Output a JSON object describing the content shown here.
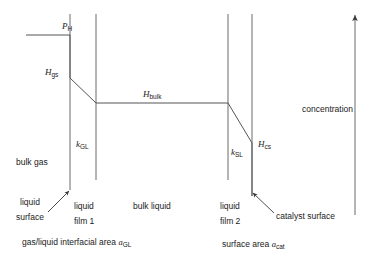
{
  "diagram": {
    "axis": {
      "name": "concentration-axis",
      "label": "concentration",
      "direction": "up",
      "x": 355,
      "y_top": 14,
      "y_bottom": 215
    },
    "profile_labels": [
      {
        "name": "p-h",
        "symbol": "P",
        "sub": "H",
        "x": 62,
        "y": 22
      },
      {
        "name": "h-gs",
        "symbol": "H",
        "sub": "gs",
        "x": 45,
        "y": 68
      },
      {
        "name": "h-bulk",
        "symbol": "H",
        "sub": "bulk",
        "x": 143,
        "y": 90
      },
      {
        "name": "h-cs",
        "symbol": "H",
        "sub": "cs",
        "x": 258,
        "y": 140
      }
    ],
    "coefficient_labels": [
      {
        "name": "k-gl",
        "symbol": "k",
        "sub": "GL",
        "x": 76,
        "y": 140
      },
      {
        "name": "k-sl",
        "symbol": "k",
        "sub": "SL",
        "x": 231,
        "y": 148
      }
    ],
    "zone_labels": [
      {
        "name": "bulk-gas",
        "text": "bulk gas",
        "x": 16,
        "y": 158
      },
      {
        "name": "bulk-liquid",
        "text": "bulk liquid",
        "x": 133,
        "y": 202
      }
    ],
    "callout_labels": [
      {
        "name": "liquid-surface",
        "line1": "liquid",
        "line2": "surface",
        "x": 10,
        "y": 198
      },
      {
        "name": "liquid-film-1",
        "line1": "liquid",
        "line2": "film 1",
        "x": 74,
        "y": 202
      },
      {
        "name": "liquid-film-2",
        "line1": "liquid",
        "line2": "film 2",
        "x": 220,
        "y": 202
      },
      {
        "name": "catalyst-surface",
        "line1": "catalyst surface",
        "line2": "",
        "x": 268,
        "y": 212
      }
    ],
    "area_labels": [
      {
        "name": "gas-liquid-interfacial-area",
        "text": "gas/liquid interfacial area ",
        "symbol": "a",
        "sub": "GL",
        "x": 22,
        "y": 238
      },
      {
        "name": "catalyst-surface-area",
        "text": "surface area ",
        "symbol": "a",
        "sub": "cat",
        "x": 222,
        "y": 240
      }
    ],
    "geometry": {
      "boundaries": [
        {
          "name": "gas-film-boundary-left",
          "x": 70,
          "y1": 14,
          "y2": 190
        },
        {
          "name": "liquid-film-1-boundary",
          "x": 96,
          "y1": 14,
          "y2": 180
        },
        {
          "name": "liquid-film-2-boundary",
          "x": 228,
          "y1": 14,
          "y2": 180
        },
        {
          "name": "catalyst-boundary-right",
          "x": 252,
          "y1": 14,
          "y2": 196
        }
      ],
      "profile_path": [
        {
          "name": "ph-plateau",
          "x1": 26,
          "y1": 35,
          "x2": 70,
          "y2": 35
        },
        {
          "name": "gas-jump",
          "x1": 70,
          "y1": 35,
          "x2": 70,
          "y2": 78
        },
        {
          "name": "liquid-film-1-drop",
          "x1": 70,
          "y1": 78,
          "x2": 96,
          "y2": 103
        },
        {
          "name": "bulk-liquid-flat",
          "x1": 96,
          "y1": 103,
          "x2": 228,
          "y2": 103
        },
        {
          "name": "liquid-film-2-drop",
          "x1": 228,
          "y1": 103,
          "x2": 252,
          "y2": 143
        },
        {
          "name": "catalyst-tail",
          "x1": 252,
          "y1": 143,
          "x2": 252,
          "y2": 196
        }
      ],
      "arrows": [
        {
          "name": "liquid-surface-arrow",
          "x1": 48,
          "y1": 212,
          "x2": 69,
          "y2": 190
        },
        {
          "name": "catalyst-surface-arrow",
          "x1": 272,
          "y1": 212,
          "x2": 252,
          "y2": 192
        }
      ]
    }
  },
  "colors": {
    "line": "#555555",
    "profile": "#555555",
    "text": "#1a1a1a",
    "background": "#ffffff"
  }
}
